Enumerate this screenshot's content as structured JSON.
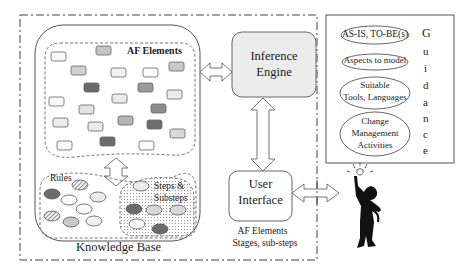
{
  "knowledge_base": {
    "title": "Knowledge Base",
    "af_elements_label": "AF Elements",
    "rules_label": "Rules",
    "steps_label_line1": "Steps &",
    "steps_label_line2": "Substeps"
  },
  "inference_engine": {
    "line1": "Inference",
    "line2": "Engine"
  },
  "user_interface": {
    "line1": "User",
    "line2": "Interface",
    "caption_line1": "AF Elements",
    "caption_line2": "Stages, sub-steps"
  },
  "guidance": {
    "vertical_title": [
      "G",
      "u",
      "i",
      "d",
      "a",
      "n",
      "c",
      "e"
    ],
    "items": [
      {
        "lines": [
          "AS-IS, TO-BE(s)"
        ]
      },
      {
        "lines": [
          "Aspects to model"
        ]
      },
      {
        "lines": [
          "Suitable",
          "Tools, Languages"
        ]
      },
      {
        "lines": [
          "Change",
          "Management",
          "Activities"
        ]
      }
    ]
  },
  "colors": {
    "light": "#f6f6f6",
    "mid_light": "#e0e0e0",
    "mid": "#b8b8b8",
    "dark": "#6e6e6e",
    "engine_fill": "#ececec",
    "stroke": "#555555"
  }
}
